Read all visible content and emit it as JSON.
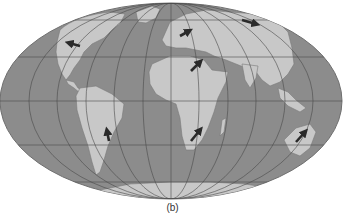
{
  "figure": {
    "caption": "(b)",
    "projection": "world-equal-area-ellipse",
    "colors": {
      "ocean": "#8c8c8c",
      "land": "#c8c8c8",
      "land_shade": "#a9a9a9",
      "graticule": "#4a4a4a",
      "arrow": "#2a2a2a",
      "background": "#ffffff"
    },
    "arrows": [
      {
        "region": "north-america",
        "direction": "west"
      },
      {
        "region": "europe",
        "direction": "northeast"
      },
      {
        "region": "siberia",
        "direction": "east"
      },
      {
        "region": "north-africa",
        "direction": "northeast"
      },
      {
        "region": "south-america",
        "direction": "north"
      },
      {
        "region": "southern-africa",
        "direction": "northeast"
      },
      {
        "region": "australia",
        "direction": "northeast"
      }
    ]
  }
}
